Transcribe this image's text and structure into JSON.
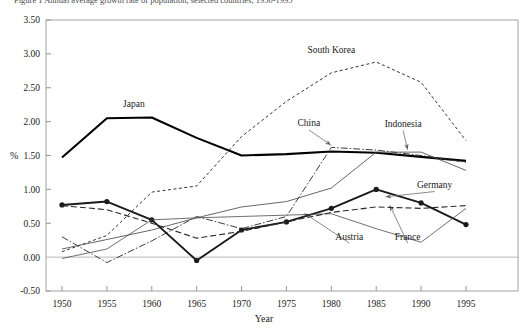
{
  "figure": {
    "caption": "Figure 1  Annual average growth rate of population, selected countries, 1950-1995"
  },
  "chart_data": {
    "type": "line",
    "title": "",
    "xlabel": "Year",
    "ylabel": "%",
    "x": [
      1950,
      1955,
      1960,
      1965,
      1970,
      1975,
      1980,
      1985,
      1990,
      1995
    ],
    "xlim": [
      1950,
      1995
    ],
    "ylim": [
      -0.5,
      3.5
    ],
    "ytick_labels": [
      "3.50",
      "3.00",
      "2.50",
      "2.00",
      "1.50",
      "1.00",
      "0.50",
      "0.00",
      "-0.50"
    ],
    "ytick_values": [
      3.5,
      3.0,
      2.5,
      2.0,
      1.5,
      1.0,
      0.5,
      0.0,
      -0.5
    ],
    "xtick_labels": [
      "1950",
      "1955",
      "1960",
      "1965",
      "1970",
      "1975",
      "1980",
      "1985",
      "1990",
      "1995"
    ],
    "grid": false,
    "legend": "inline-annotations",
    "series": [
      {
        "name": "Japan",
        "style": "thick-solid",
        "color": "#000000",
        "width": 2.1,
        "dash": "none",
        "markers": false,
        "values": [
          1.47,
          2.05,
          2.06,
          1.76,
          1.5,
          1.52,
          1.56,
          1.54,
          1.48,
          1.42
        ],
        "label": {
          "x": 1958.0,
          "y": 2.22,
          "anchor": "middle",
          "leader": false
        }
      },
      {
        "name": "South Korea",
        "style": "fine-dashed",
        "color": "#333333",
        "width": 1.0,
        "dash": "3,2.5",
        "markers": false,
        "values": [
          0.08,
          0.32,
          0.96,
          1.05,
          1.78,
          2.3,
          2.72,
          2.88,
          2.58,
          1.72
        ],
        "label": {
          "x": 1980.0,
          "y": 3.02,
          "anchor": "middle",
          "leader": false
        }
      },
      {
        "name": "China",
        "style": "dash-dot",
        "color": "#333333",
        "width": 0.95,
        "dash": "7,2,1.5,2",
        "markers": false,
        "values": [
          0.3,
          -0.08,
          0.24,
          0.6,
          0.42,
          0.6,
          1.62,
          1.58,
          1.5,
          1.4
        ],
        "label": {
          "x": 1977.5,
          "y": 1.93,
          "anchor": "middle",
          "leader": true,
          "leader_to": {
            "x": 1980.0,
            "y": 1.62
          }
        }
      },
      {
        "name": "Indonesia",
        "style": "thin-solid",
        "color": "#4a4a4a",
        "width": 0.85,
        "dash": "none",
        "markers": false,
        "values": [
          0.12,
          0.26,
          0.4,
          0.58,
          0.74,
          0.82,
          1.02,
          1.55,
          1.55,
          1.28
        ],
        "label": {
          "x": 1988.0,
          "y": 1.92,
          "anchor": "middle",
          "leader": true,
          "leader_to": {
            "x": 1988.5,
            "y": 1.55
          }
        }
      },
      {
        "name": "Germany",
        "style": "thick-solid-markers",
        "color": "#1a1a1a",
        "width": 1.9,
        "dash": "none",
        "markers": true,
        "values": [
          0.77,
          0.82,
          0.55,
          -0.05,
          0.4,
          0.52,
          0.72,
          1.0,
          0.8,
          0.48
        ],
        "label": {
          "x": 1991.5,
          "y": 1.02,
          "anchor": "middle",
          "leader": true,
          "leader_to": {
            "x": 1986.0,
            "y": 0.86
          }
        }
      },
      {
        "name": "Austria",
        "style": "thin-solid",
        "color": "#4a4a4a",
        "width": 0.8,
        "dash": "none",
        "markers": false,
        "values": [
          -0.02,
          0.12,
          0.55,
          0.58,
          0.6,
          0.62,
          0.64,
          0.42,
          0.22,
          0.72
        ],
        "label": {
          "x": 1982.0,
          "y": 0.26,
          "anchor": "middle",
          "leader": true,
          "leader_to": {
            "x": 1977.0,
            "y": 0.62
          }
        }
      },
      {
        "name": "France",
        "style": "long-dashed",
        "color": "#2a2a2a",
        "width": 1.1,
        "dash": "6,3",
        "markers": false,
        "values": [
          0.76,
          0.7,
          0.5,
          0.28,
          0.38,
          0.52,
          0.66,
          0.74,
          0.72,
          0.76
        ],
        "label": {
          "x": 1988.5,
          "y": 0.26,
          "anchor": "middle",
          "leader": true,
          "leader_to": {
            "x": 1986.5,
            "y": 0.74
          }
        }
      }
    ]
  }
}
